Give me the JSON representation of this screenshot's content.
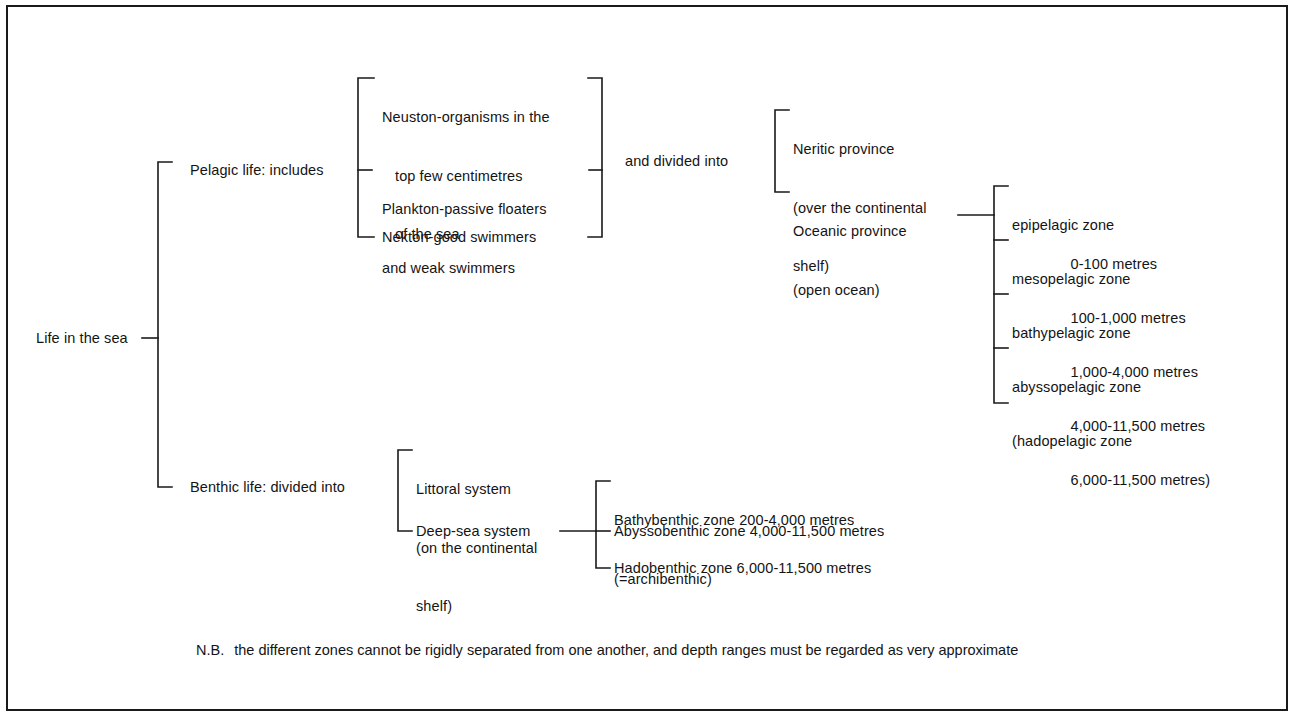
{
  "diagram": {
    "title": "Life in the sea",
    "root_label": "Life in the sea",
    "note_prefix": "N.B.",
    "note_text": "the different zones cannot be rigidly separated from one another, and depth ranges must be regarded as very approximate",
    "frame_color": "#1a1a1a",
    "line_color": "#1a1a1a",
    "text_color": "#141414",
    "background_color": "#ffffff",
    "branches": {
      "pelagic_label": "Pelagic life: includes",
      "benthic_label": "Benthic life: divided into",
      "divided_into_label": "and divided into"
    },
    "pelagic_groups": [
      {
        "line1": "Neuston-organisms in the",
        "line2": "top few centimetres",
        "line3": "of the sea"
      },
      {
        "line1": "Plankton-passive floaters",
        "line2": "and weak swimmers",
        "line3": ""
      },
      {
        "line1": "Nekton-good swimmers",
        "line2": "",
        "line3": ""
      }
    ],
    "provinces": [
      {
        "line1": "Neritic province",
        "line2": "(over the continental",
        "line3": "shelf)"
      },
      {
        "line1": "Oceanic province",
        "line2": "(open ocean)",
        "line3": ""
      }
    ],
    "pelagic_zones": [
      {
        "name": "epipelagic zone",
        "depth": "0-100 metres"
      },
      {
        "name": "mesopelagic zone",
        "depth": "100-1,000 metres"
      },
      {
        "name": "bathypelagic zone",
        "depth": "1,000-4,000 metres"
      },
      {
        "name": "abyssopelagic zone",
        "depth": "4,000-11,500 metres"
      },
      {
        "name": "(hadopelagic zone",
        "depth": "6,000-11,500 metres)"
      }
    ],
    "benthic_systems": [
      {
        "line1": "Littoral system",
        "line2": "(on the continental",
        "line3": "shelf)"
      },
      {
        "line1": "Deep-sea system",
        "line2": "",
        "line3": ""
      }
    ],
    "benthic_zones": [
      {
        "line1": "Bathybenthic zone 200-4,000 metres",
        "line2": "(=archibenthic)"
      },
      {
        "line1": "Abyssobenthic zone 4,000-11,500 metres",
        "line2": ""
      },
      {
        "line1": "Hadobenthic zone 6,000-11,500 metres",
        "line2": ""
      }
    ]
  }
}
